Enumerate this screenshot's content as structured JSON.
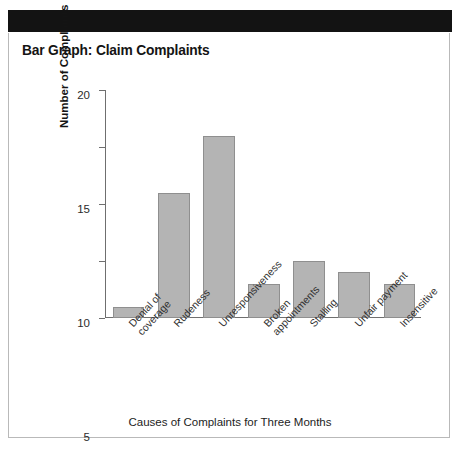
{
  "header": {
    "band_color": "#131313"
  },
  "chart_title": "Bar Graph: Claim Complaints",
  "axis": {
    "y_title": "Number of Complaints",
    "x_title": "Causes of Complaints for Three Months"
  },
  "colors": {
    "bar_fill": "#b4b4b4",
    "bar_border": "#8f8f8f",
    "axis": "#6f6f6f",
    "card_border": "#b9b9b9",
    "text": "#1a1a1a"
  },
  "chart_data": {
    "type": "bar",
    "title": "Bar Graph: Claim Complaints",
    "xlabel": "Causes of Complaints for Three Months",
    "ylabel": "Number of Complaints",
    "categories": [
      "Denial of coverage",
      "Rudeness",
      "Unresponsiveness",
      "Broken appointments",
      "Stalling",
      "Unfair payment",
      "Insensitive"
    ],
    "category_lines": [
      [
        "Denial of",
        "coverage"
      ],
      [
        "Rudeness"
      ],
      [
        "Unresponsiveness"
      ],
      [
        "Broken",
        "appointments"
      ],
      [
        "Stalling"
      ],
      [
        "Unfair payment"
      ],
      [
        "Insensitive"
      ]
    ],
    "values": [
      1,
      11,
      16,
      3,
      5,
      4,
      3
    ],
    "ylim": [
      0,
      20
    ],
    "yticks": [
      0,
      5,
      10,
      15,
      20
    ],
    "ytick_labels": [
      "0",
      "5",
      "10",
      "15",
      "20"
    ],
    "grid": false,
    "legend": false
  }
}
